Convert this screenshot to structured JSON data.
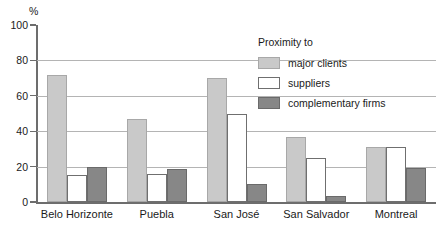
{
  "chart_data": {
    "type": "bar",
    "title": "",
    "subtitle": "",
    "xlabel": "",
    "ylabel": "%",
    "ylim": [
      0,
      100
    ],
    "yticks": [
      0,
      20,
      40,
      60,
      80,
      100
    ],
    "grid": true,
    "grid_axis": "y",
    "legend": {
      "title": "Proximity to",
      "position": "inside-top-right",
      "entries": [
        "major clients",
        "suppliers",
        "complementary firms"
      ]
    },
    "categories": [
      "Belo Horizonte",
      "Puebla",
      "San José",
      "San Salvador",
      "Montreal"
    ],
    "series": [
      {
        "name": "major clients",
        "color": "#c9c9c9",
        "values": [
          72,
          47,
          70,
          37,
          31
        ]
      },
      {
        "name": "suppliers",
        "color": "#ffffff",
        "values": [
          15,
          16,
          50,
          25,
          31
        ]
      },
      {
        "name": "complementary firms",
        "color": "#878787",
        "values": [
          20,
          18.5,
          10,
          3.5,
          19
        ]
      }
    ]
  },
  "axis": {
    "unit_label": "%",
    "tick_labels": [
      "0",
      "20",
      "40",
      "60",
      "80",
      "100"
    ]
  }
}
